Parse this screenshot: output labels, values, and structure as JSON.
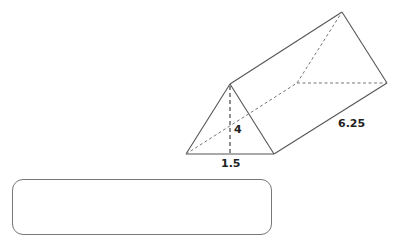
{
  "figure": {
    "shape": "triangular-prism",
    "vertices": {
      "front_left": [
        186,
        154
      ],
      "front_right": [
        274,
        154
      ],
      "front_apex": [
        230,
        84
      ],
      "back_left": [
        297,
        83
      ],
      "back_right": [
        387,
        83
      ],
      "back_apex": [
        342,
        12
      ],
      "height_foot": [
        230,
        154
      ]
    },
    "labels": {
      "height": "4",
      "base": "1.5",
      "length": "6.25"
    }
  },
  "answer_box": {
    "value": ""
  }
}
